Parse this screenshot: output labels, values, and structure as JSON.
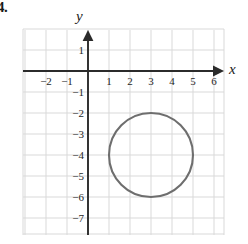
{
  "problem": {
    "number_label": "4."
  },
  "axes": {
    "x_label": "x",
    "y_label": "y",
    "x_ticks": [
      {
        "value": -2,
        "label": "−2"
      },
      {
        "value": -1,
        "label": "−1"
      },
      {
        "value": 1,
        "label": "1"
      },
      {
        "value": 2,
        "label": "2"
      },
      {
        "value": 3,
        "label": "3"
      },
      {
        "value": 4,
        "label": "4"
      },
      {
        "value": 5,
        "label": "5"
      },
      {
        "value": 6,
        "label": "6"
      }
    ],
    "y_ticks": [
      {
        "value": 1,
        "label": "1"
      },
      {
        "value": -1,
        "label": "−1"
      },
      {
        "value": -2,
        "label": "−2"
      },
      {
        "value": -3,
        "label": "−3"
      },
      {
        "value": -4,
        "label": "−4"
      },
      {
        "value": -5,
        "label": "−5"
      },
      {
        "value": -6,
        "label": "−6"
      },
      {
        "value": -7,
        "label": "−7"
      }
    ]
  },
  "colors": {
    "grid": "#d9d9d9",
    "axis": "#2b2b2b",
    "curve": "#6e6e6e",
    "text": "#1a1a1a",
    "background": "#ffffff"
  },
  "chart_data": {
    "type": "scatter",
    "title": "",
    "xlabel": "x",
    "ylabel": "y",
    "grid": true,
    "legend": "none",
    "xlim": [
      -3,
      6.5
    ],
    "ylim": [
      -7.8,
      1.9
    ],
    "xticks": [
      -2,
      -1,
      1,
      2,
      3,
      4,
      5,
      6
    ],
    "yticks": [
      1,
      -1,
      -2,
      -3,
      -4,
      -5,
      -6,
      -7
    ],
    "annotations": [],
    "series": [
      {
        "name": "circle",
        "type": "circle",
        "center": [
          3,
          -4
        ],
        "radius": 2,
        "equation": "(x − 3)² + (y + 4)² = 4",
        "extremes": {
          "top": [
            3,
            -2
          ],
          "bottom": [
            3,
            -6
          ],
          "left": [
            1,
            -4
          ],
          "right": [
            5,
            -4
          ]
        },
        "color": "#6e6e6e",
        "filled": false
      }
    ]
  }
}
